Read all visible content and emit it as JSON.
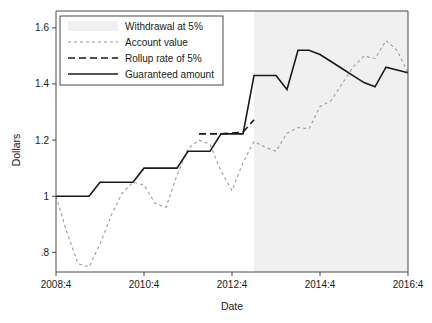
{
  "chart_data": {
    "type": "line",
    "title": "",
    "xlabel": "Date",
    "ylabel": "Dollars",
    "grid": false,
    "legend_position": "top-left",
    "xlim": [
      2008.75,
      2016.75
    ],
    "ylim": [
      0.73,
      1.66
    ],
    "x_tick_labels": [
      "2008:4",
      "2010:4",
      "2012:4",
      "2014:4",
      "2016:4"
    ],
    "x_tick_values": [
      2008.75,
      2010.75,
      2012.75,
      2014.75,
      2016.75
    ],
    "y_tick_labels": [
      "1.6",
      "1.4",
      "1.2",
      "1",
      ".8"
    ],
    "y_tick_values": [
      1.6,
      1.4,
      1.2,
      1.0,
      0.8
    ],
    "shaded_region": {
      "label": "Withdrawal at 5%",
      "x_start": 2013.25,
      "x_end": 2016.75,
      "color": "#f0f0f0"
    },
    "series": [
      {
        "name": "Account value",
        "style": "short-dashed",
        "color": "#9a9a9a",
        "x": [
          2008.75,
          2009.0,
          2009.25,
          2009.5,
          2009.75,
          2010.0,
          2010.25,
          2010.5,
          2010.75,
          2011.0,
          2011.25,
          2011.5,
          2011.75,
          2012.0,
          2012.25,
          2012.5,
          2012.75,
          2013.0,
          2013.25,
          2013.5,
          2013.75,
          2014.0,
          2014.25,
          2014.5,
          2014.75,
          2015.0,
          2015.25,
          2015.5,
          2015.75,
          2016.0,
          2016.25,
          2016.5,
          2016.75
        ],
        "y": [
          1.0,
          0.87,
          0.76,
          0.748,
          0.83,
          0.93,
          1.01,
          1.05,
          1.04,
          0.975,
          0.96,
          1.075,
          1.17,
          1.2,
          1.185,
          1.09,
          1.02,
          1.12,
          1.195,
          1.175,
          1.16,
          1.225,
          1.245,
          1.24,
          1.32,
          1.34,
          1.4,
          1.46,
          1.5,
          1.49,
          1.555,
          1.52,
          1.44
        ]
      },
      {
        "name": "Rollup rate of 5%",
        "style": "long-dashed",
        "color": "#1a1a1a",
        "x": [
          2012.0,
          2012.25,
          2012.5,
          2012.75,
          2013.0,
          2013.25
        ],
        "y": [
          1.222,
          1.222,
          1.222,
          1.225,
          1.228,
          1.272
        ]
      },
      {
        "name": "Guaranteed amount",
        "style": "solid",
        "color": "#1a1a1a",
        "x": [
          2008.75,
          2009.0,
          2009.25,
          2009.5,
          2009.75,
          2010.0,
          2010.25,
          2010.5,
          2010.75,
          2011.0,
          2011.25,
          2011.5,
          2011.75,
          2012.0,
          2012.25,
          2012.5,
          2012.75,
          2013.0,
          2013.25,
          2013.5,
          2013.75,
          2014.0,
          2014.25,
          2014.5,
          2014.75,
          2015.0,
          2015.25,
          2015.5,
          2015.75,
          2016.0,
          2016.25,
          2016.5,
          2016.75
        ],
        "y": [
          1.0,
          1.0,
          1.0,
          1.0,
          1.05,
          1.05,
          1.05,
          1.05,
          1.1,
          1.1,
          1.1,
          1.1,
          1.16,
          1.16,
          1.16,
          1.222,
          1.222,
          1.222,
          1.43,
          1.43,
          1.43,
          1.38,
          1.52,
          1.52,
          1.505,
          1.48,
          1.455,
          1.43,
          1.405,
          1.39,
          1.46,
          1.45,
          1.44
        ]
      }
    ],
    "legend_entries": [
      {
        "label": "Withdrawal at 5%",
        "style": "swatch",
        "color": "#f0f0f0"
      },
      {
        "label": "Account value",
        "style": "short-dashed",
        "color": "#9a9a9a"
      },
      {
        "label": "Rollup rate of 5%",
        "style": "long-dashed",
        "color": "#1a1a1a"
      },
      {
        "label": "Guaranteed amount",
        "style": "solid",
        "color": "#1a1a1a"
      }
    ]
  }
}
